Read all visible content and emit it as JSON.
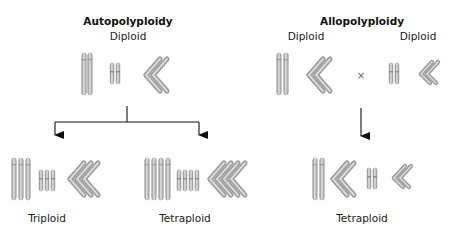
{
  "autopolyploidy": {
    "title": "Autopolyploidy",
    "parent_label": "Diploid",
    "children": [
      {
        "label": "Triploid",
        "copies": 3
      },
      {
        "label": "Tetraploid",
        "copies": 4
      }
    ]
  },
  "allopolyploidy": {
    "title": "Allopolyploidy",
    "parent_left_label": "Diploid",
    "parent_right_label": "Diploid",
    "cross_symbol": "×",
    "child_label": "Tetraploid"
  },
  "colors": {
    "chromosome_fill": "#b3b3b3",
    "chromosome_edge": "#8c8c8c",
    "chromosome_highlight": "#e0e0e0",
    "arrow": "#111111"
  }
}
